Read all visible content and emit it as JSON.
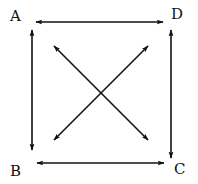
{
  "diagram": {
    "type": "bidirectional-graph",
    "nodes": [
      {
        "id": "A",
        "label": "A",
        "x": 16,
        "y": 17
      },
      {
        "id": "D",
        "label": "D",
        "x": 177,
        "y": 15
      },
      {
        "id": "B",
        "label": "B",
        "x": 16,
        "y": 172
      },
      {
        "id": "C",
        "label": "C",
        "x": 180,
        "y": 170
      }
    ],
    "edges": [
      {
        "from": "A",
        "to": "D",
        "direction": "both"
      },
      {
        "from": "A",
        "to": "B",
        "direction": "both"
      },
      {
        "from": "D",
        "to": "C",
        "direction": "both"
      },
      {
        "from": "B",
        "to": "C",
        "direction": "both"
      },
      {
        "from": "A",
        "to": "C",
        "direction": "both"
      },
      {
        "from": "D",
        "to": "B",
        "direction": "both"
      }
    ],
    "colors": {
      "stroke": "#111111",
      "background": "#ffffff"
    }
  },
  "labels": {
    "a": "A",
    "b": "B",
    "c": "C",
    "d": "D"
  }
}
